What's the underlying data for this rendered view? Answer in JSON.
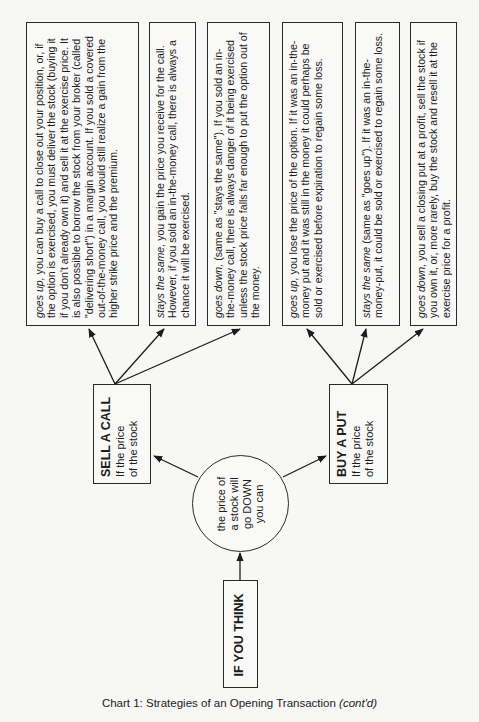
{
  "diagram": {
    "root": {
      "label": "IF YOU THINK"
    },
    "condition": {
      "lines": [
        "the price of",
        "a stock will",
        "go DOWN",
        "you can"
      ]
    },
    "strategies": [
      {
        "title": "SELL A CALL",
        "subtitle_lines": [
          "If the price",
          "of the stock"
        ],
        "outcomes": [
          {
            "lead": "goes up,",
            "text": " you can buy a call to close out your position, or, if the option is exercised, you must deliver the stock (buying it if you don't already own it) and sell it at the exercise price. It is also possible to borrow the stock from your broker (called \"delivering short\") in a margin account. If you sold a covered out-of-the-money call, you would still realize a gain from the higher strike price and the premium."
          },
          {
            "lead": "stays the same,",
            "text": " you gain the price you receive for the call. However, if you sold an in-the-money call, there is always a chance it will be exercised."
          },
          {
            "lead": "goes down,",
            "text": " (same as \"stays the same\"). If you sold an in-the-money call, there is always danger of it being exercised unless the stock price falls far enough to put the option out of the money."
          }
        ]
      },
      {
        "title": "BUY A PUT",
        "subtitle_lines": [
          "If the price",
          "of the stock"
        ],
        "outcomes": [
          {
            "lead": "goes up,",
            "text": " you lose the price of the option. If it was an in-the-money put and it was still in the money it could perhaps be sold or exercised before expiration to regain some loss."
          },
          {
            "lead": "stays the same",
            "text": " (same as \"goes up\"). If it was an in-the-money-put, it could be sold or exercised to regain some loss."
          },
          {
            "lead": "goes down,",
            "text": " you sell a closing put at a profit, sell the stock if you own it, or, more rarely, buy the stock and resell it at the exercise price for a profit."
          }
        ]
      }
    ]
  },
  "caption": {
    "main": "Chart 1: Strategies of an Opening Transaction ",
    "italic": "(cont'd)"
  }
}
